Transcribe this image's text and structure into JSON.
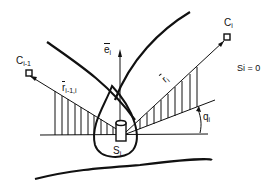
{
  "diagram": {
    "labels": {
      "c_prev": {
        "main": "C",
        "sub": "i-1"
      },
      "c_i": {
        "main": "C",
        "sub": "i"
      },
      "e_i": {
        "main": "e",
        "sub": "i"
      },
      "r_prev_i": {
        "main": "r",
        "sub": "i-1,i"
      },
      "r_i": {
        "main": "r",
        "sub": "i"
      },
      "s_i": {
        "main": "S",
        "sub": "i"
      },
      "q_i": {
        "main": "q",
        "sub": "i"
      },
      "condition": "Si = 0"
    },
    "colors": {
      "stroke": "#111111",
      "background": "#ffffff"
    }
  }
}
